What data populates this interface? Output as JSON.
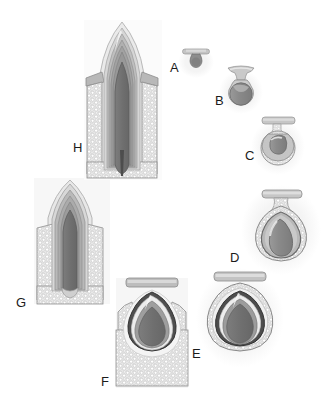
{
  "figure": {
    "background_color": "#ffffff",
    "label_color": "#1b1b1b",
    "palette": {
      "outline": "#8e8e8e",
      "dark_outline": "#3a3a3a",
      "enamel_organ_light": "#e3e3e3",
      "enamel_organ_mid": "#cfcfcf",
      "dental_papilla": "#8f8f8f",
      "dental_papilla_dark": "#7a7a7a",
      "pulp_dark": "#6e6e6e",
      "bone_stipple": "#c8c8c8",
      "bone_fill": "#dcdcdc",
      "oral_epithelium": "#b9b9b9",
      "enamel_dark_band": "#4a4a4a",
      "dentin_band": "#9d9d9d",
      "soft_shadow": "#efefef"
    }
  },
  "stages": [
    {
      "id": "A",
      "label": "A",
      "name": "bud-stage",
      "label_x": 170,
      "label_y": 72,
      "center_x": 196,
      "center_y": 62,
      "scale": 0.38,
      "description": "Bud stage: small epithelial bud from the dental lamina with an anvil shaped oral epithelium above.",
      "has_bone": false,
      "has_stipple": false,
      "shape": "bud"
    },
    {
      "id": "B",
      "label": "B",
      "name": "early-cap-stage",
      "label_x": 215,
      "label_y": 105,
      "center_x": 241,
      "center_y": 90,
      "scale": 0.58,
      "description": "Early cap stage: enlarging enamel organ capping a condensing dental papilla.",
      "has_bone": false,
      "has_stipple": false,
      "shape": "cap"
    },
    {
      "id": "C",
      "label": "C",
      "name": "cap-stage",
      "label_x": 245,
      "label_y": 160,
      "center_x": 278,
      "center_y": 146,
      "scale": 0.72,
      "description": "Cap stage: enamel organ with stellate reticulum; dental papilla indented by the inner enamel epithelium.",
      "has_bone": false,
      "has_stipple": true,
      "shape": "cap"
    },
    {
      "id": "D",
      "label": "D",
      "name": "early-bell-stage",
      "label_x": 230,
      "label_y": 262,
      "center_x": 281,
      "center_y": 228,
      "scale": 1.0,
      "description": "Early bell stage: bell shaped enamel organ surrounded by the developing bony crypt.",
      "has_bone": true,
      "has_stipple": true,
      "shape": "bell"
    },
    {
      "id": "E",
      "label": "E",
      "name": "late-bell-stage",
      "label_x": 192,
      "label_y": 358,
      "center_x": 240,
      "center_y": 317,
      "scale": 1.12,
      "description": "Late bell / apposition stage: enamel and dentin deposited at the cusp tip inside the bony crypt.",
      "has_bone": true,
      "has_stipple": true,
      "shape": "bell-crown"
    },
    {
      "id": "F",
      "label": "F",
      "name": "crown-formation-stage",
      "label_x": 101,
      "label_y": 386,
      "center_x": 152,
      "center_y": 320,
      "scale": 1.0,
      "description": "Crown completed: fully formed crown within the alveolar bone before eruption begins.",
      "has_bone": true,
      "has_stipple": true,
      "shape": "crown"
    },
    {
      "id": "G",
      "label": "G",
      "name": "root-formation-eruption",
      "label_x": 16,
      "label_y": 307,
      "center_x": 70,
      "center_y": 245,
      "scale": 1.0,
      "description": "Root formation and eruption: elongating root with open apex, tooth moving toward the oral cavity.",
      "has_bone": true,
      "has_stipple": true,
      "shape": "erupting"
    },
    {
      "id": "H",
      "label": "H",
      "name": "erupted-mature-tooth",
      "label_x": 73,
      "label_y": 152,
      "center_x": 122,
      "center_y": 105,
      "scale": 1.0,
      "description": "Erupted tooth with completed root, periodontal ligament and surrounding alveolar bone.",
      "has_bone": true,
      "has_stipple": true,
      "shape": "erupted"
    }
  ]
}
